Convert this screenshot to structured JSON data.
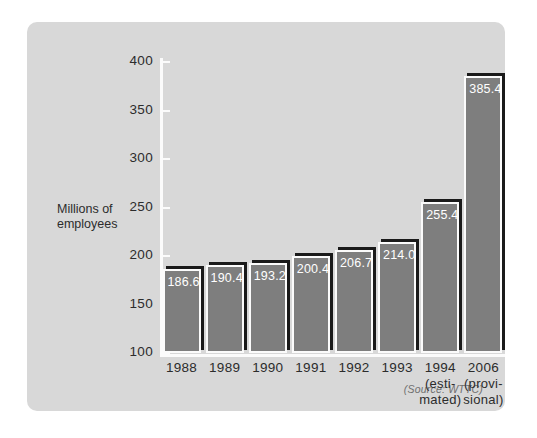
{
  "panel": {
    "background_color": "#d8d8d8",
    "page_background_color": "#ffffff"
  },
  "source_note": "(Source: WTTC)",
  "axis_title_line1": "Millions of",
  "axis_title_line2": "employees",
  "colors": {
    "bar_fill": "#7e7e7e",
    "bar_outline": "#fbfbfb",
    "bar_shadow": "#1a1a1a",
    "axis": "#fbfbfb",
    "text": "#2c2c2c",
    "value_text": "#ffffff"
  },
  "chart_data": {
    "type": "bar",
    "title": "",
    "xlabel": "",
    "ylabel": "Millions of employees",
    "ylim": [
      100,
      400
    ],
    "yticks": [
      100,
      150,
      200,
      250,
      300,
      350,
      400
    ],
    "ytick_labels": [
      "100",
      "150",
      "200",
      "250",
      "300",
      "350",
      "400"
    ],
    "grid": false,
    "legend": false,
    "categories": [
      "1988",
      "1989",
      "1990",
      "1991",
      "1992",
      "1993",
      "1994",
      "2006"
    ],
    "category_sublabels": [
      [
        "1988"
      ],
      [
        "1989"
      ],
      [
        "1990"
      ],
      [
        "1991"
      ],
      [
        "1992"
      ],
      [
        "1993"
      ],
      [
        "1994",
        "(esti-",
        "mated)"
      ],
      [
        "2006",
        "(provi-",
        "sional)"
      ]
    ],
    "values": [
      186.6,
      190.4,
      193.2,
      200.4,
      206.7,
      214.0,
      255.4,
      385.4
    ],
    "value_labels": [
      "186.6",
      "190.4",
      "193.2",
      "200.4",
      "206.7",
      "214.0",
      "255.4",
      "385.4"
    ],
    "annotations": [
      "(Source: WTTC)"
    ]
  }
}
